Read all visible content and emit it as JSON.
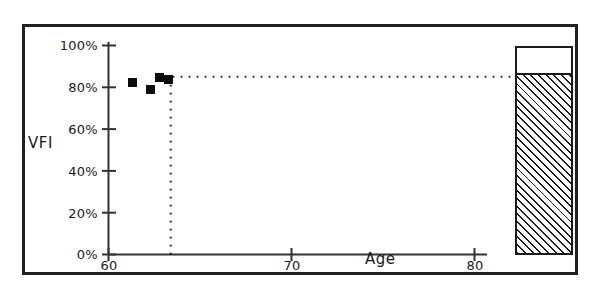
{
  "chart_data": {
    "type": "scatter",
    "title": "",
    "xlabel": "Age",
    "ylabel": "VFI",
    "xlim": [
      60,
      80
    ],
    "ylim": [
      0,
      100
    ],
    "grid": false,
    "legend": "none",
    "x_ticks": [
      "60",
      "70",
      "80"
    ],
    "x_tick_values": [
      60,
      70,
      80
    ],
    "y_ticks": [
      "0%",
      "20%",
      "40%",
      "60%",
      "80%",
      "100%"
    ],
    "y_tick_values": [
      0,
      20,
      40,
      60,
      80,
      100
    ],
    "series": [
      {
        "name": "VFI measurements",
        "marker": "filled-square",
        "color": "#0d0d0d",
        "points": [
          {
            "x": 61.3,
            "y": 82.5
          },
          {
            "x": 62.3,
            "y": 79.0
          },
          {
            "x": 62.8,
            "y": 84.5
          },
          {
            "x": 63.3,
            "y": 83.5
          }
        ]
      }
    ],
    "annotations": [
      {
        "name": "horizontal-reference-line",
        "style": "dotted",
        "orientation": "horizontal",
        "y": 85,
        "x_start": 63.4,
        "x_end": 80.0
      },
      {
        "name": "vertical-reference-line",
        "style": "dotted",
        "orientation": "vertical",
        "x": 63.4,
        "y_start": 0,
        "y_end": 85
      }
    ],
    "bar": {
      "name": "summary-bar",
      "fill": "diagonal-hatch",
      "outline_color": "#1a1a1a",
      "value": 85,
      "max": 100,
      "x_start": 82.2,
      "x_end": 85.4
    }
  },
  "axes": {
    "y_title": "VFI",
    "x_title": "Age",
    "y_tick_labels": [
      "100%",
      "80%",
      "60%",
      "40%",
      "20%",
      "0%"
    ],
    "x_tick_labels": [
      "60",
      "70",
      "80"
    ]
  }
}
